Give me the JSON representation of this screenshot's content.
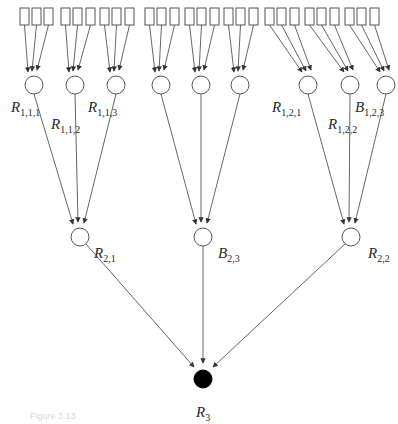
{
  "diagram": {
    "type": "tree",
    "colors": {
      "stroke": "#555555",
      "root_fill": "#000000",
      "node_fill": "#ffffff"
    },
    "root": {
      "id": "R3",
      "letter": "R",
      "sub": "3",
      "filled": true
    },
    "level2": [
      {
        "id": "R21",
        "letter": "R",
        "sub": "2,1",
        "children": [
          "R111",
          "R112",
          "R113"
        ]
      },
      {
        "id": "B23",
        "letter": "B",
        "sub": "2,3",
        "children": [
          "A1",
          "A2",
          "A3"
        ]
      },
      {
        "id": "R22",
        "letter": "R",
        "sub": "2,2",
        "children": [
          "R121",
          "R122",
          "B123"
        ]
      }
    ],
    "level1": [
      {
        "id": "R111",
        "letter": "R",
        "sub": "1,1,1",
        "labeled": true
      },
      {
        "id": "R112",
        "letter": "R",
        "sub": "1,1,2",
        "labeled": true
      },
      {
        "id": "R113",
        "letter": "R",
        "sub": "1,1,3",
        "labeled": true
      },
      {
        "id": "A1",
        "letter": "",
        "sub": "",
        "labeled": false
      },
      {
        "id": "A2",
        "letter": "",
        "sub": "",
        "labeled": false
      },
      {
        "id": "A3",
        "letter": "",
        "sub": "",
        "labeled": false
      },
      {
        "id": "R121",
        "letter": "R",
        "sub": "1,2,1",
        "labeled": true
      },
      {
        "id": "R122",
        "letter": "R",
        "sub": "1,2,2",
        "labeled": true
      },
      {
        "id": "B123",
        "letter": "B",
        "sub": "1,2,3",
        "labeled": true
      }
    ],
    "leaves_per_level1_node": 3,
    "leaf_count": 27
  },
  "caption": "Figure 3.13"
}
